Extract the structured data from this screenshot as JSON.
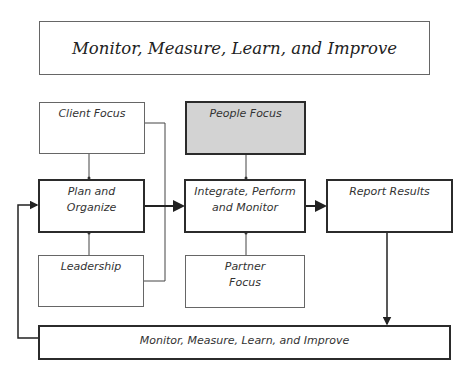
{
  "diagram": {
    "header_box": {
      "label": "Monitor, Measure, Learn, and Improve"
    },
    "nodes": {
      "client_focus": {
        "label": "Client Focus"
      },
      "people_focus": {
        "label": "People Focus",
        "fill": "#d3d3d3"
      },
      "plan_organize": {
        "line1": "Plan and",
        "line2": "Organize"
      },
      "integrate": {
        "line1": "Integrate, Perform",
        "line2": "and Monitor"
      },
      "report_results": {
        "label": "Report Results"
      },
      "leadership": {
        "label": "Leadership"
      },
      "partner_focus": {
        "line1": "Partner",
        "line2": "Focus"
      },
      "monitor_loop": {
        "label": "Monitor, Measure, Learn, and Improve"
      }
    },
    "edges": [
      {
        "from": "Client Focus",
        "to": "Plan and Organize"
      },
      {
        "from": "Leadership",
        "to": "Plan and Organize"
      },
      {
        "from": "Client Focus",
        "to": "Leadership",
        "type": "connector"
      },
      {
        "from": "People Focus",
        "to": "Integrate, Perform and Monitor"
      },
      {
        "from": "Partner Focus",
        "to": "Integrate, Perform and Monitor"
      },
      {
        "from": "Plan and Organize",
        "to": "Integrate, Perform and Monitor"
      },
      {
        "from": "Integrate, Perform and Monitor",
        "to": "Report Results"
      },
      {
        "from": "Report Results",
        "to": "Monitor, Measure, Learn, and Improve"
      },
      {
        "from": "Monitor, Measure, Learn, and Improve",
        "to": "Plan and Organize"
      }
    ]
  }
}
